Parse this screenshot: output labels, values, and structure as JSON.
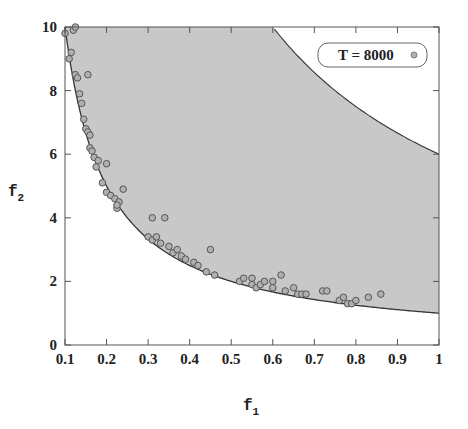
{
  "chart_data": {
    "type": "scatter",
    "title": "",
    "xlabel": "f",
    "xlabel_sub": "1",
    "ylabel": "f",
    "ylabel_sub": "2",
    "xlim": [
      0.1,
      1.0
    ],
    "ylim": [
      0,
      10
    ],
    "xticks": [
      0.1,
      0.2,
      0.3,
      0.4,
      0.5,
      0.6,
      0.7,
      0.8,
      0.9,
      1
    ],
    "xtick_labels": [
      "0.1",
      "0.2",
      "0.3",
      "0.4",
      "0.5",
      "0.6",
      "0.7",
      "0.8",
      "0.9",
      "1"
    ],
    "yticks": [
      0,
      2,
      4,
      6,
      8,
      10
    ],
    "ytick_labels": [
      "0",
      "2",
      "4",
      "6",
      "8",
      "10"
    ],
    "grid": false,
    "legend": {
      "position": "upper right",
      "entries": [
        "T = 8000"
      ]
    },
    "feasible_region": {
      "lower_curve": "f2 = 1/f1",
      "upper_curve": "f2 = 6/f1",
      "fill": "#c8c8c8"
    },
    "series": [
      {
        "name": "T = 8000",
        "marker": "circle",
        "points": [
          [
            0.1,
            9.8
          ],
          [
            0.12,
            9.9
          ],
          [
            0.125,
            10.0
          ],
          [
            0.115,
            9.2
          ],
          [
            0.11,
            9.0
          ],
          [
            0.125,
            8.5
          ],
          [
            0.13,
            8.4
          ],
          [
            0.155,
            8.5
          ],
          [
            0.135,
            7.9
          ],
          [
            0.14,
            7.6
          ],
          [
            0.145,
            7.1
          ],
          [
            0.15,
            6.8
          ],
          [
            0.155,
            6.7
          ],
          [
            0.16,
            6.6
          ],
          [
            0.16,
            6.2
          ],
          [
            0.165,
            6.1
          ],
          [
            0.17,
            5.9
          ],
          [
            0.18,
            5.8
          ],
          [
            0.175,
            5.6
          ],
          [
            0.2,
            5.7
          ],
          [
            0.19,
            5.1
          ],
          [
            0.2,
            4.8
          ],
          [
            0.21,
            4.7
          ],
          [
            0.22,
            4.6
          ],
          [
            0.225,
            4.3
          ],
          [
            0.23,
            4.5
          ],
          [
            0.24,
            4.9
          ],
          [
            0.225,
            4.4
          ],
          [
            0.31,
            4.0
          ],
          [
            0.34,
            4.0
          ],
          [
            0.3,
            3.4
          ],
          [
            0.31,
            3.3
          ],
          [
            0.32,
            3.4
          ],
          [
            0.33,
            3.2
          ],
          [
            0.35,
            3.1
          ],
          [
            0.36,
            2.9
          ],
          [
            0.37,
            3.0
          ],
          [
            0.38,
            2.8
          ],
          [
            0.39,
            2.7
          ],
          [
            0.41,
            2.6
          ],
          [
            0.42,
            2.5
          ],
          [
            0.45,
            3.0
          ],
          [
            0.44,
            2.3
          ],
          [
            0.46,
            2.2
          ],
          [
            0.52,
            2.0
          ],
          [
            0.53,
            2.1
          ],
          [
            0.55,
            2.1
          ],
          [
            0.55,
            1.9
          ],
          [
            0.56,
            1.8
          ],
          [
            0.57,
            1.9
          ],
          [
            0.58,
            2.0
          ],
          [
            0.6,
            1.8
          ],
          [
            0.6,
            2.0
          ],
          [
            0.62,
            2.2
          ],
          [
            0.63,
            1.7
          ],
          [
            0.65,
            1.8
          ],
          [
            0.66,
            1.6
          ],
          [
            0.67,
            1.6
          ],
          [
            0.68,
            1.6
          ],
          [
            0.72,
            1.7
          ],
          [
            0.73,
            1.7
          ],
          [
            0.76,
            1.4
          ],
          [
            0.77,
            1.5
          ],
          [
            0.78,
            1.3
          ],
          [
            0.79,
            1.3
          ],
          [
            0.8,
            1.4
          ],
          [
            0.83,
            1.5
          ],
          [
            0.86,
            1.6
          ]
        ]
      }
    ]
  },
  "legend": {
    "label": "T = 8000"
  },
  "colors": {
    "fill": "#c8c8c8",
    "curve": "#333333",
    "marker_fill": "#b0b0b0",
    "marker_stroke": "#555555",
    "axis": "#555555"
  }
}
